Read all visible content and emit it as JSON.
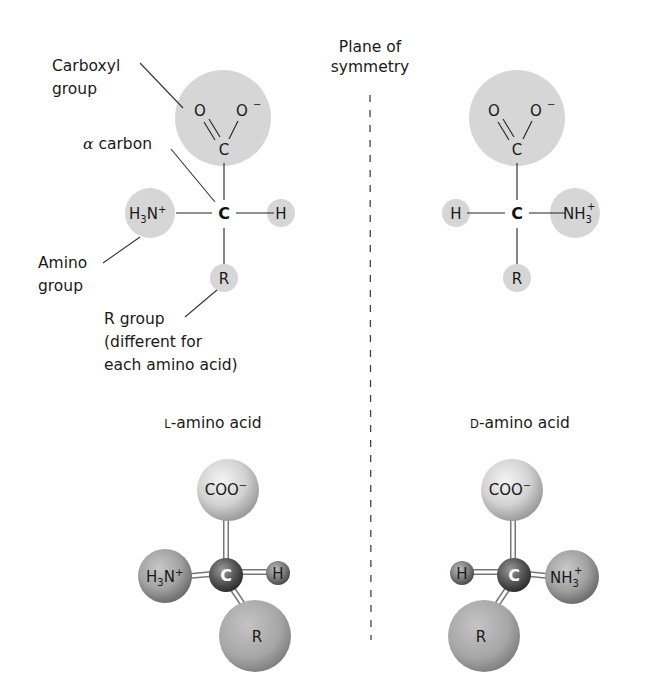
{
  "figure": {
    "type": "stereochemistry-diagram"
  },
  "plane": {
    "label_line1": "Plane of",
    "label_line2": "symmetry"
  },
  "labels": {
    "carboxyl_line1": "Carboxyl",
    "carboxyl_line2": "group",
    "alpha_carbon_symbol": "α",
    "alpha_carbon_text": "carbon",
    "amino_line1": "Amino",
    "amino_line2": "group",
    "r_group_line1": "R group",
    "r_group_line2": "(different for",
    "r_group_line3": "each amino acid)"
  },
  "left_structure": {
    "carboxyl_o_double": "O",
    "carboxyl_o_single": "O",
    "carboxyl_o_charge": "−",
    "carboxyl_c": "C",
    "alpha_c": "C",
    "amino_h": "H",
    "amino_sub": "3",
    "amino_n": "N",
    "amino_charge": "+",
    "hydrogen": "H",
    "r": "R"
  },
  "right_structure": {
    "carboxyl_o_double": "O",
    "carboxyl_o_single": "O",
    "carboxyl_o_charge": "−",
    "carboxyl_c": "C",
    "alpha_c": "C",
    "hydrogen": "H",
    "amino_nh": "NH",
    "amino_sub": "3",
    "amino_charge": "+",
    "r": "R"
  },
  "models": {
    "left_title_prefix": "L",
    "left_title_rest": "-amino acid",
    "right_title_prefix": "D",
    "right_title_rest": "-amino acid",
    "left": {
      "coo": "COO",
      "coo_charge": "−",
      "c": "C",
      "amino_h": "H",
      "amino_sub": "3",
      "amino_n": "N",
      "amino_charge": "+",
      "h": "H",
      "r": "R"
    },
    "right": {
      "coo": "COO",
      "coo_charge": "−",
      "c": "C",
      "h": "H",
      "amino_nh": "NH",
      "amino_sub": "3",
      "amino_charge": "+",
      "r": "R"
    }
  },
  "colors": {
    "group_fill": "#d6d6d6",
    "sphere_light": "#e4e4e4",
    "sphere_mid": "#9a9a9a",
    "sphere_dark": "#4a4a4a",
    "text": "#1a1a1a"
  }
}
